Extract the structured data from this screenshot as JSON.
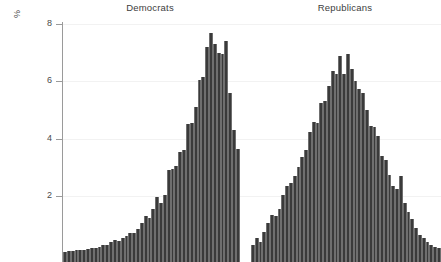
{
  "figure": {
    "background": "#ffffff",
    "bar_color": "#3a3a3a",
    "grid_color": "#f2f2f2",
    "axis_color": "#9a9a9a"
  },
  "yaxis": {
    "label": "%",
    "ticks": [
      2,
      4,
      6,
      8
    ],
    "tick_labels": [
      "2",
      "4",
      "6",
      "8"
    ],
    "range": [
      0,
      8.4
    ],
    "note_cropped_bottom": "image is cut off below the axis; no x-axis tick labels are visible"
  },
  "panels": [
    {
      "title": "Democrats"
    },
    {
      "title": "Republicans"
    }
  ],
  "chart_data": {
    "type": "bar",
    "title": "",
    "subtitle": "",
    "xlabel": "",
    "ylabel": "%",
    "ylim": [
      0,
      8.4
    ],
    "yticks": [
      2,
      4,
      6,
      8
    ],
    "grid": true,
    "legend": "none",
    "layout": "two side-by-side histogram panels sharing one y-axis",
    "series": [
      {
        "name": "Democrats",
        "panel": "Democrats",
        "values": [
          0.05,
          0.07,
          0.08,
          0.1,
          0.12,
          0.12,
          0.15,
          0.18,
          0.2,
          0.22,
          0.28,
          0.3,
          0.38,
          0.45,
          0.42,
          0.52,
          0.6,
          0.72,
          0.7,
          0.85,
          1.05,
          1.3,
          1.25,
          1.55,
          1.95,
          1.75,
          2.05,
          2.9,
          2.95,
          3.05,
          3.55,
          3.6,
          4.5,
          4.55,
          5.1,
          6.05,
          6.15,
          7.2,
          7.7,
          7.3,
          7.0,
          6.95,
          7.4,
          5.6,
          4.3,
          3.65
        ]
      },
      {
        "name": "Republicans",
        "panel": "Republicans",
        "values": [
          0.3,
          0.55,
          0.4,
          0.75,
          1.05,
          1.35,
          1.3,
          1.55,
          2.05,
          2.35,
          2.45,
          2.7,
          3.0,
          3.35,
          3.6,
          4.25,
          4.6,
          4.55,
          5.25,
          5.3,
          5.85,
          6.35,
          6.25,
          6.9,
          6.25,
          6.95,
          6.45,
          6.0,
          5.75,
          5.6,
          5.0,
          4.45,
          4.4,
          4.1,
          3.4,
          3.25,
          2.75,
          2.35,
          2.25,
          2.7,
          1.75,
          1.45,
          1.2,
          0.9,
          0.65,
          0.55,
          0.4,
          0.3,
          0.22,
          0.18
        ]
      }
    ]
  }
}
